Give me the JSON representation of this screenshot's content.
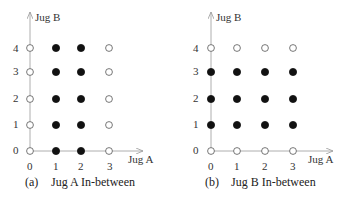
{
  "figure": {
    "panels": [
      {
        "id": "a",
        "caption_tag": "(a)",
        "caption_text": "Jug A In-between",
        "x_axis_label": "Jug A",
        "y_axis_label": "Jug B",
        "x_ticks": [
          "0",
          "1",
          "2",
          "3"
        ],
        "y_ticks": [
          "0",
          "1",
          "2",
          "3",
          "4"
        ],
        "filled_rule": "x in {1,2}",
        "grid": [
          [
            "open",
            "filled",
            "filled",
            "open"
          ],
          [
            "open",
            "filled",
            "filled",
            "open"
          ],
          [
            "open",
            "filled",
            "filled",
            "open"
          ],
          [
            "open",
            "filled",
            "filled",
            "open"
          ],
          [
            "open",
            "filled",
            "filled",
            "open"
          ]
        ]
      },
      {
        "id": "b",
        "caption_tag": "(b)",
        "caption_text": "Jug B In-between",
        "x_axis_label": "Jug A",
        "y_axis_label": "Jug B",
        "x_ticks": [
          "0",
          "1",
          "2",
          "3"
        ],
        "y_ticks": [
          "0",
          "1",
          "2",
          "3",
          "4"
        ],
        "filled_rule": "y in {1,2,3}",
        "grid": [
          [
            "open",
            "open",
            "open",
            "open"
          ],
          [
            "filled",
            "filled",
            "filled",
            "filled"
          ],
          [
            "filled",
            "filled",
            "filled",
            "filled"
          ],
          [
            "filled",
            "filled",
            "filled",
            "filled"
          ],
          [
            "open",
            "open",
            "open",
            "open"
          ]
        ]
      }
    ],
    "colors": {
      "axis": "#999999",
      "point_fill": "#111111",
      "point_stroke": "#555555",
      "text": "#222222"
    }
  }
}
